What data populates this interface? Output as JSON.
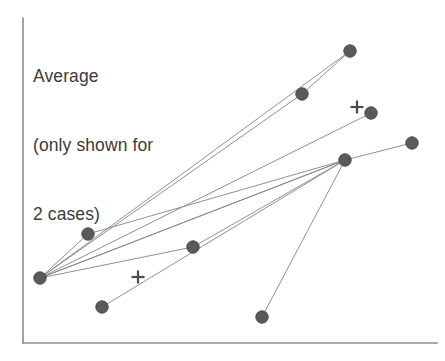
{
  "figure": {
    "width": 445,
    "height": 361,
    "background_color": "#ffffff",
    "annotation": {
      "name": "average-annotation",
      "lines": [
        "Average",
        "(only shown for",
        "2 cases)"
      ],
      "line1": "Average",
      "line2": "(only shown for",
      "line3": "2 cases)",
      "color": "#3b3b3b",
      "x": 33,
      "y": 19
    },
    "axes": {
      "color": "#8c8c8c",
      "line_width": 1.6,
      "y_axis": {
        "x": 23,
        "y_top": 18,
        "y_bottom": 343
      },
      "x_axis": {
        "y": 343,
        "x_left": 23,
        "x_right": 437
      },
      "x_tick_labels": [],
      "y_tick_labels": [],
      "grid": false
    }
  },
  "chart_data": {
    "type": "scatter",
    "title": "",
    "subtitle": "",
    "xlabel": "",
    "ylabel": "",
    "xlim": [
      0,
      445
    ],
    "ylim": [
      361,
      0
    ],
    "grid": false,
    "legend": "none",
    "annotations": [
      {
        "text": "Average\n(only shown for\n2 cases)",
        "x": 33,
        "y": 19,
        "anchor": "top-left"
      }
    ],
    "marker_style": {
      "shape": "circle",
      "radius": 6.2,
      "fill": "#5a5a5a",
      "edge_color": "#4a4a4a",
      "edge_width": 1
    },
    "line_style": {
      "color": "#8a8a8a",
      "width": 1,
      "opacity": 0.95
    },
    "points": [
      {
        "id": "p-left-hub",
        "label": "left hub",
        "x": 40,
        "y": 278
      },
      {
        "id": "p-top-right",
        "label": "top right",
        "x": 350,
        "y": 51
      },
      {
        "id": "p-upper-mid",
        "label": "upper middle",
        "x": 302,
        "y": 94
      },
      {
        "id": "p-near-cross-1",
        "label": "right of upper cross",
        "x": 371,
        "y": 113
      },
      {
        "id": "p-far-right",
        "label": "far right",
        "x": 412,
        "y": 143
      },
      {
        "id": "p-right-hub",
        "label": "right hub",
        "x": 345,
        "y": 160
      },
      {
        "id": "p-left-mid",
        "label": "left middle",
        "x": 88,
        "y": 234
      },
      {
        "id": "p-center",
        "label": "center",
        "x": 193,
        "y": 247
      },
      {
        "id": "p-lower-left",
        "label": "lower left",
        "x": 102,
        "y": 307
      },
      {
        "id": "p-bottom-mid",
        "label": "bottom middle",
        "x": 262,
        "y": 317
      }
    ],
    "cross_markers": [
      {
        "id": "cross-upper",
        "label": "average marker upper",
        "x": 357,
        "y": 107,
        "size": 13
      },
      {
        "id": "cross-lower",
        "label": "average marker lower",
        "x": 138,
        "y": 277,
        "size": 13
      }
    ],
    "segments": [
      {
        "id": "seg-hub-to-uppermid",
        "from": "p-left-hub",
        "to": "p-upper-mid"
      },
      {
        "id": "seg-uppermid-to-topright",
        "from": "p-upper-mid",
        "to": "p-top-right"
      },
      {
        "id": "seg-hub-to-topright",
        "from": "p-left-hub",
        "to": "p-top-right"
      },
      {
        "id": "seg-hub-to-nearcross",
        "from": "p-left-hub",
        "to": "p-near-cross-1"
      },
      {
        "id": "seg-hub-to-righthub-a",
        "from": "p-left-hub",
        "to": "p-right-hub"
      },
      {
        "id": "seg-hub-to-righthub-b",
        "from": "p-left-hub",
        "to": "p-right-hub"
      },
      {
        "id": "seg-leftmid-to-righthub",
        "from": "p-left-mid",
        "to": "p-right-hub"
      },
      {
        "id": "seg-hub-to-leftmid",
        "from": "p-left-hub",
        "to": "p-left-mid"
      },
      {
        "id": "seg-hub-to-center",
        "from": "p-left-hub",
        "to": "p-center"
      },
      {
        "id": "seg-center-to-righthub",
        "from": "p-center",
        "to": "p-right-hub"
      },
      {
        "id": "seg-righthub-to-farright",
        "from": "p-right-hub",
        "to": "p-far-right"
      },
      {
        "id": "seg-righthub-to-bottommid",
        "from": "p-right-hub",
        "to": "p-bottom-mid"
      },
      {
        "id": "seg-lowerleft-to-righthub",
        "from": "p-lower-left",
        "to": "p-right-hub"
      }
    ]
  }
}
